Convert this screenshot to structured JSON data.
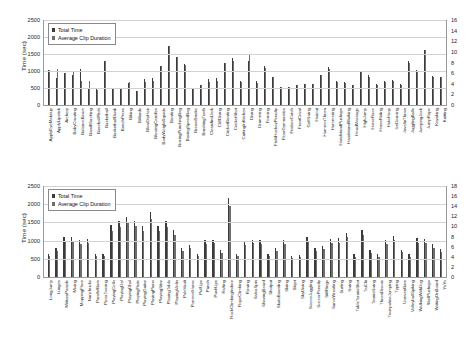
{
  "chart_data": [
    {
      "id": "top",
      "type": "bar",
      "title": "",
      "xlabel": "",
      "ylabel": "Time (sec)",
      "ylim": [
        0,
        2500
      ],
      "yticks": [
        0,
        500,
        1000,
        1500,
        2000,
        2500
      ],
      "y2lim": [
        0,
        16
      ],
      "y2ticks": [
        0,
        2,
        4,
        6,
        8,
        10,
        12,
        14,
        16
      ],
      "grid": true,
      "legend_position": "top-left",
      "legend": [
        "Total Time",
        "Average Clip Duration"
      ],
      "categories": [
        "ApplyEyeMakeup",
        "ApplyLipstick",
        "Archery",
        "BabyCrawling",
        "BalanceBeam",
        "BandMarching",
        "BaseballPitch",
        "Basketball",
        "BasketballDunk",
        "BenchPress",
        "Biking",
        "Billiards",
        "BlowDryHair",
        "BlowingCandles",
        "BodyWeightSquats",
        "Bowling",
        "BoxingPunchingBag",
        "BoxingSpeedBag",
        "BreastStroke",
        "BrushingTeeth",
        "CleanAndJerk",
        "CliffDiving",
        "CricketBowling",
        "CricketShot",
        "CuttingInKitchen",
        "Diving",
        "Drumming",
        "Fencing",
        "FieldHockeyPenalty",
        "FloorGymnastics",
        "FrisbeeCatch",
        "FrontCrawl",
        "GolfSwing",
        "Haircut",
        "HammerThrow",
        "Hammering",
        "HandstandPushups",
        "HandstandWalking",
        "HeadMassage",
        "HighJump",
        "HorseRace",
        "HorseRiding",
        "HulaHoop",
        "IceDancing",
        "JavelinThrow",
        "JugglingBalls",
        "JumpingJack",
        "JumpRope",
        "Kayaking",
        "Knitting"
      ],
      "series": [
        {
          "name": "Total Time",
          "axis": "left",
          "values": [
            1020,
            790,
            930,
            870,
            1060,
            500,
            500,
            1290,
            510,
            490,
            640,
            420,
            760,
            800,
            1160,
            1740,
            1410,
            1200,
            500,
            590,
            770,
            790,
            1240,
            1370,
            700,
            1290,
            700,
            1150,
            820,
            520,
            540,
            580,
            620,
            630,
            880,
            1110,
            700,
            680,
            590,
            1010,
            870,
            610,
            700,
            740,
            610,
            1290,
            1030,
            1620,
            840,
            820
          ]
        },
        {
          "name": "Average Clip Duration",
          "axis": "right",
          "values": [
            6.5,
            6.8,
            6.0,
            6.4,
            4.6,
            4.5,
            2.9,
            8.2,
            3.2,
            3.0,
            4.4,
            2.6,
            4.3,
            4.5,
            7.3,
            11.2,
            9.1,
            7.6,
            3.1,
            3.7,
            4.4,
            4.6,
            7.9,
            8.2,
            4.4,
            9.5,
            4.1,
            7.0,
            5.2,
            3.3,
            3.4,
            3.7,
            3.9,
            3.9,
            5.6,
            6.8,
            4.3,
            4.2,
            3.7,
            6.3,
            5.2,
            3.8,
            4.3,
            4.6,
            3.8,
            7.9,
            6.4,
            10.3,
            5.3,
            5.2
          ]
        }
      ]
    },
    {
      "id": "bottom",
      "type": "bar",
      "title": "",
      "xlabel": "",
      "ylabel": "Time (sec)",
      "ylim": [
        0,
        2500
      ],
      "yticks": [
        0,
        500,
        1000,
        1500,
        2000,
        2500
      ],
      "y2lim": [
        0,
        18
      ],
      "y2ticks": [
        0,
        2,
        4,
        6,
        8,
        10,
        12,
        14,
        16,
        18
      ],
      "grid": true,
      "legend_position": "top-left",
      "legend": [
        "Total Time",
        "Average Clip Duration"
      ],
      "categories": [
        "LongJump",
        "Lunges",
        "MilitaryParade",
        "Mixing",
        "MoppingFloor",
        "Nunchucks",
        "ParallelBars",
        "PizzaTossing",
        "PlayingCello",
        "PlayingDaf",
        "PlayingDhol",
        "PlayingFlute",
        "PlayingGuitar",
        "PlayingPiano",
        "PlayingSitar",
        "PlayingTabla",
        "PlayingViolin",
        "PoleVault",
        "PommelHorse",
        "PullUps",
        "Punch",
        "PushUps",
        "Rafting",
        "RockClimbingIndoor",
        "RopeClimbing",
        "Rowing",
        "SalsaSpin",
        "ShavingBeard",
        "Shotput",
        "SkateBoarding",
        "Skiing",
        "Skijet",
        "SkyDiving",
        "SoccerJuggling",
        "SoccerPenalty",
        "StillRings",
        "SumoWrestling",
        "Surfing",
        "Swing",
        "TableTennisShot",
        "TaiChi",
        "TennisSwing",
        "ThrowDiscus",
        "TrampolineJumping",
        "Typing",
        "UnevenBars",
        "VolleyballSpiking",
        "WalkingWithDog",
        "WallPushups",
        "WritingOnBoard",
        "YoYo"
      ],
      "series": [
        {
          "name": "Total Time",
          "axis": "left",
          "values": [
            640,
            790,
            1090,
            1100,
            1020,
            1040,
            630,
            640,
            1420,
            1530,
            1660,
            1550,
            1410,
            1780,
            1410,
            1530,
            1300,
            790,
            890,
            630,
            1030,
            1030,
            740,
            2180,
            640,
            980,
            1030,
            1020,
            640,
            800,
            1010,
            580,
            610,
            1090,
            800,
            860,
            1050,
            1060,
            1220,
            620,
            1300,
            730,
            620,
            1020,
            1140,
            750,
            620,
            1060,
            1040,
            900,
            780
          ]
        },
        {
          "name": "Average Clip Duration",
          "axis": "right",
          "values": [
            4.1,
            5.1,
            7.0,
            7.1,
            6.6,
            6.7,
            4.1,
            4.1,
            9.2,
            9.9,
            10.7,
            10.0,
            9.1,
            11.5,
            9.1,
            9.9,
            8.4,
            5.1,
            5.8,
            4.1,
            6.6,
            6.7,
            4.8,
            14.1,
            4.1,
            6.3,
            6.7,
            6.6,
            4.1,
            5.2,
            6.5,
            3.8,
            3.9,
            7.0,
            5.2,
            5.6,
            6.8,
            6.8,
            7.9,
            4.0,
            8.4,
            4.7,
            4.0,
            6.6,
            7.4,
            4.9,
            4.0,
            6.8,
            6.7,
            5.8,
            5.0
          ]
        }
      ]
    }
  ]
}
